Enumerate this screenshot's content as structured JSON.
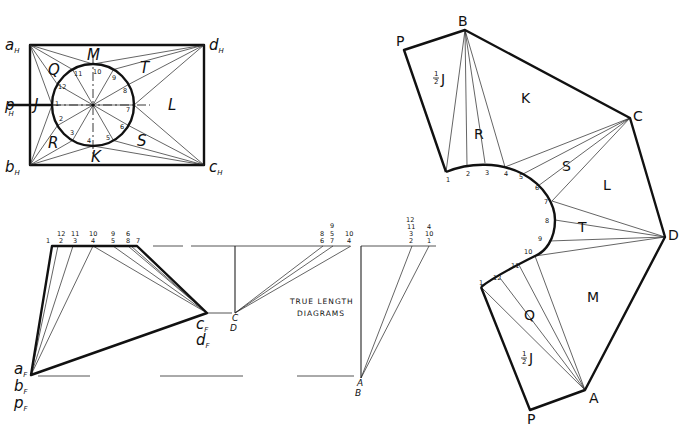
{
  "plan_view": {
    "corner_labels": {
      "a": "a",
      "d": "d",
      "b": "b",
      "c": "c",
      "p": "p",
      "sub": "H"
    },
    "region_labels": {
      "M": "M",
      "Q": "Q",
      "T": "T",
      "J": "J",
      "L": "L",
      "R": "R",
      "S": "S",
      "K": "K"
    },
    "circle_points": [
      "1",
      "2",
      "3",
      "4",
      "5",
      "6",
      "7",
      "8",
      "9",
      "10",
      "11",
      "12"
    ]
  },
  "front_view": {
    "labels": {
      "a": "a",
      "b": "b",
      "p": "p",
      "c": "c",
      "d": "d",
      "sub": "F"
    },
    "top_numbers_row1": [
      "1",
      "12",
      "11",
      "10",
      "9",
      "6",
      "7"
    ],
    "top_numbers_row2": [
      "2",
      "3",
      "4",
      "5",
      "8"
    ]
  },
  "true_length": {
    "caption_line1": "TRUE LENGTH",
    "caption_line2": "DIAGRAMS",
    "cd_labels": {
      "c": "C",
      "d": "D"
    },
    "ab_labels": {
      "a": "A",
      "b": "B"
    },
    "cd_numbers": {
      "col1": [
        "8",
        "6"
      ],
      "col2": [
        "9",
        "5",
        "7"
      ],
      "col3": [
        "10",
        "4"
      ]
    },
    "ab_numbers": {
      "col1": [
        "12",
        "11",
        "3",
        "2"
      ],
      "col2": [
        "4",
        "10",
        "1"
      ]
    }
  },
  "development": {
    "vertex_labels": {
      "P_top": "P",
      "B": "B",
      "C": "C",
      "D": "D",
      "A": "A",
      "P_bottom": "P"
    },
    "region_labels": {
      "half_J_top": "J",
      "half_J_bottom": "J",
      "K": "K",
      "R": "R",
      "S": "S",
      "L": "L",
      "T": "T",
      "M": "M",
      "Q": "Q",
      "half_num": "1",
      "half_den": "2"
    },
    "curve_points": [
      "1",
      "2",
      "3",
      "4",
      "5",
      "6",
      "7",
      "8",
      "9",
      "10",
      "11",
      "12",
      "1"
    ]
  }
}
